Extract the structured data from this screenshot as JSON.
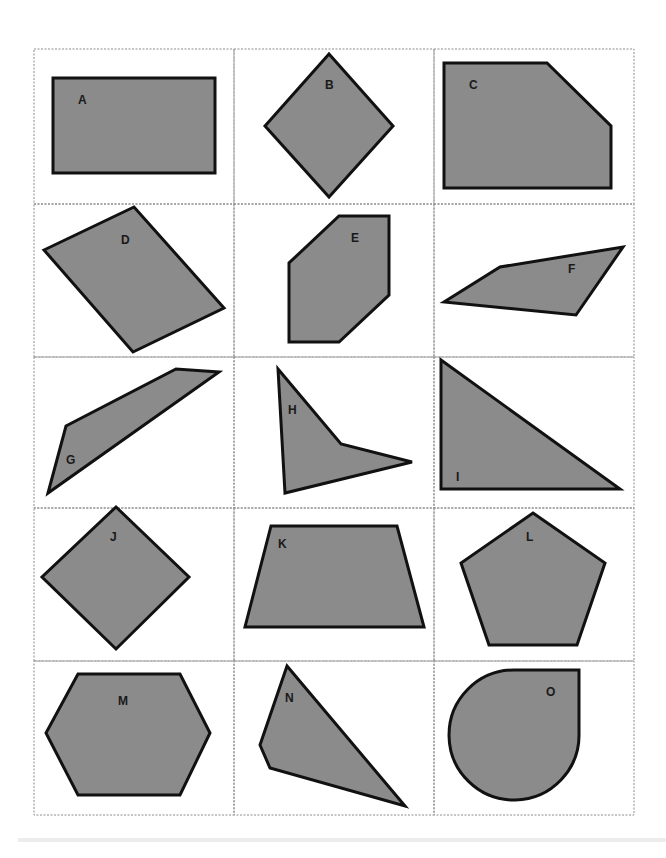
{
  "worksheet": {
    "title": "Shape cards",
    "grid": {
      "rows": 5,
      "cols": 3
    },
    "colors": {
      "fill": "#8b8b8b",
      "stroke": "#111111",
      "grid": "#8c8c8c",
      "background": "#ffffff"
    },
    "shapes": [
      {
        "label": "A",
        "kind": "rectangle"
      },
      {
        "label": "B",
        "kind": "square (rotated)"
      },
      {
        "label": "C",
        "kind": "pentagon (truncated rectangle)"
      },
      {
        "label": "D",
        "kind": "parallelogram"
      },
      {
        "label": "E",
        "kind": "hexagon"
      },
      {
        "label": "F",
        "kind": "quadrilateral"
      },
      {
        "label": "G",
        "kind": "quadrilateral"
      },
      {
        "label": "H",
        "kind": "concave quadrilateral"
      },
      {
        "label": "I",
        "kind": "right triangle"
      },
      {
        "label": "J",
        "kind": "square (rotated)"
      },
      {
        "label": "K",
        "kind": "trapezoid"
      },
      {
        "label": "L",
        "kind": "regular pentagon"
      },
      {
        "label": "M",
        "kind": "hexagon"
      },
      {
        "label": "N",
        "kind": "quadrilateral"
      },
      {
        "label": "O",
        "kind": "teardrop (curved shape)"
      }
    ]
  }
}
